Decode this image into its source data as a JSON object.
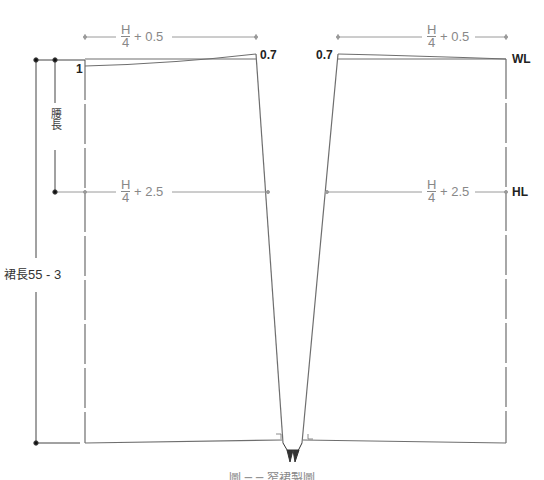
{
  "diagram": {
    "type": "skirt-pattern-draft",
    "colors": {
      "outline": "#6e6e6e",
      "guide": "#9a9a9a",
      "text_dark": "#222222",
      "text_gray": "#888888"
    },
    "back_panel": {
      "waist_formula": {
        "num": "H",
        "den": "4",
        "plus": "+ 0.5"
      },
      "hip_formula": {
        "num": "H",
        "den": "4",
        "plus": "+ 2.5"
      },
      "waist_drop": "1",
      "waist_rise": "0.7"
    },
    "front_panel": {
      "waist_formula": {
        "num": "H",
        "den": "4",
        "plus": "+ 0.5"
      },
      "hip_formula": {
        "num": "H",
        "den": "4",
        "plus": "+ 2.5"
      },
      "waist_rise": "0.7",
      "waist_line_label": "WL",
      "hip_line_label": "HL"
    },
    "dimensions": {
      "hip_depth_label": "腰長",
      "skirt_length_label": "裙長",
      "skirt_length_value": "55 - 3"
    },
    "caption": "圖 ─ ─ 窄裙製圖"
  }
}
